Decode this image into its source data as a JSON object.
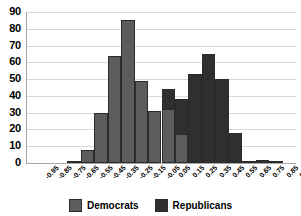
{
  "chart_data": {
    "type": "bar",
    "title": "",
    "subtitle": "",
    "xlabel": "",
    "ylabel": "",
    "ylim": [
      0,
      90
    ],
    "ytick_step": 10,
    "yticks": [
      90,
      80,
      70,
      60,
      50,
      40,
      30,
      20,
      10,
      0
    ],
    "grid": true,
    "legend_position": "bottom",
    "bar_overlap": "overlaid",
    "categories": [
      "-0.95",
      "-0.85",
      "-0.75",
      "-0.65",
      "-0.55",
      "-0.45",
      "-0.35",
      "-0.25",
      "-0.15",
      "-0.05",
      "0.05",
      "0.15",
      "0.25",
      "0.35",
      "0.45",
      "0.55",
      "0.65",
      "0.75",
      "0.85",
      "0.95"
    ],
    "series": [
      {
        "name": "Democrats",
        "color": "#5c5c5c",
        "values": [
          0,
          0,
          0,
          1,
          8,
          30,
          64,
          85,
          49,
          31,
          32,
          17,
          0,
          0,
          0,
          0,
          0,
          0,
          0,
          0
        ]
      },
      {
        "name": "Republicans",
        "color": "#2f2f2f",
        "values": [
          0,
          0,
          0,
          0,
          0,
          0,
          0,
          0,
          0,
          0,
          44,
          38,
          53,
          65,
          50,
          18,
          1,
          2,
          1,
          0
        ]
      }
    ]
  },
  "legend": {
    "items": [
      {
        "label": "Democrats",
        "color": "#5c5c5c"
      },
      {
        "label": "Republicans",
        "color": "#2f2f2f"
      }
    ]
  },
  "axes": {
    "y_tick_labels": [
      "90",
      "80",
      "70",
      "60",
      "50",
      "40",
      "30",
      "20",
      "10",
      "0"
    ],
    "x_tick_labels": [
      "-0.95",
      "-0.85",
      "-0.75",
      "-0.65",
      "-0.55",
      "-0.45",
      "-0.35",
      "-0.25",
      "-0.15",
      "-0.05",
      "0.05",
      "0.15",
      "0.25",
      "0.35",
      "0.45",
      "0.55",
      "0.65",
      "0.75",
      "0.85",
      "0.95"
    ]
  }
}
